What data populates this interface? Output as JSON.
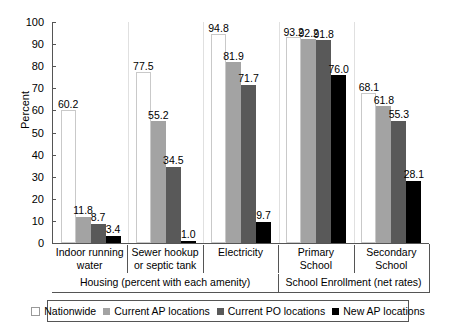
{
  "chart_data": {
    "type": "bar",
    "title": "",
    "xlabel": "",
    "ylabel": "Percent",
    "ylim": [
      0,
      100
    ],
    "ytick_step": 10,
    "yticks": [
      0,
      10,
      20,
      30,
      40,
      50,
      60,
      70,
      80,
      90,
      100
    ],
    "grid": false,
    "legend_position": "bottom",
    "categories": [
      "Indoor running water",
      "Sewer hookup or septic tank",
      "Electricity",
      "Primary School",
      "Secondary School"
    ],
    "category_lines": [
      [
        "Indoor running",
        "water"
      ],
      [
        "Sewer hookup",
        "or septic tank"
      ],
      [
        "Electricity",
        ""
      ],
      [
        "Primary",
        "School"
      ],
      [
        "Secondary",
        "School"
      ]
    ],
    "super_groups": [
      {
        "label": "Housing (percent with each amenity)",
        "span": 3
      },
      {
        "label": "School Enrollment (net rates)",
        "span": 2
      }
    ],
    "series": [
      {
        "name": "Nationwide",
        "color": "#ffffff",
        "values": [
          60.2,
          77.5,
          94.8,
          93.2,
          68.1
        ]
      },
      {
        "name": "Current AP locations",
        "color": "#a3a3a3",
        "values": [
          11.8,
          55.2,
          81.9,
          92.2,
          61.8
        ]
      },
      {
        "name": "Current PO locations",
        "color": "#595959",
        "values": [
          8.7,
          34.5,
          71.7,
          91.8,
          55.3
        ]
      },
      {
        "name": "New AP locations",
        "color": "#000000",
        "values": [
          3.4,
          1.0,
          9.7,
          76.0,
          28.1
        ]
      }
    ]
  }
}
